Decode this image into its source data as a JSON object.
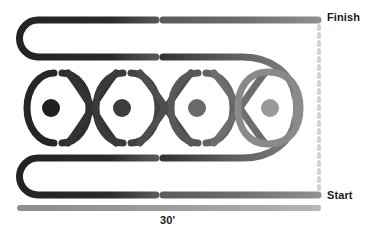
{
  "diagram": {
    "labels": {
      "finish": "Finish",
      "start": "Start",
      "distance": "30'"
    },
    "colors": {
      "darkest": "#2b2b2b",
      "dark": "#3a3a3a",
      "mid_dark": "#4a4a4a",
      "mid": "#5e5e5e",
      "mid_light": "#6e6e6e",
      "light": "#8c8c8c",
      "lightest": "#a5a5a5",
      "dashed_guide": "#cfcfcf",
      "background": "#ffffff",
      "text": "#1a1a1a"
    },
    "cones": [
      {
        "id": "cone-1",
        "cx": 51,
        "cy": 108,
        "r": 9,
        "color": "#1f1f1f"
      },
      {
        "id": "cone-2",
        "cx": 122,
        "cy": 108,
        "r": 9,
        "color": "#3c3c3c"
      },
      {
        "id": "cone-3",
        "cx": 197,
        "cy": 108,
        "r": 9,
        "color": "#6a6a6a"
      },
      {
        "id": "cone-4",
        "cx": 270,
        "cy": 108,
        "r": 9,
        "color": "#9a9a9a"
      }
    ],
    "loops": [
      {
        "id": "loop-1",
        "cx": 51,
        "cy": 108,
        "broken": true
      },
      {
        "id": "loop-2",
        "cx": 122,
        "cy": 108,
        "broken": true
      },
      {
        "id": "loop-3",
        "cx": 197,
        "cy": 108,
        "broken": true
      },
      {
        "id": "loop-4",
        "cx": 270,
        "cy": 108,
        "broken": false
      }
    ],
    "lanes": [
      {
        "id": "lane-finish",
        "y": 20,
        "x_start": 20,
        "x_end": 318
      },
      {
        "id": "lane-upper-return",
        "y": 57,
        "x_start": 20,
        "x_end": 250
      },
      {
        "id": "lane-lower-return",
        "y": 158,
        "x_start": 20,
        "x_end": 250
      },
      {
        "id": "lane-start",
        "y": 195,
        "x_start": 20,
        "x_end": 318
      }
    ],
    "measure_line": {
      "id": "measure-line",
      "y": 208,
      "x_start": 20,
      "x_end": 318
    },
    "guide_line": {
      "id": "guide-line",
      "x": 319,
      "y_start": 20,
      "y_end": 195,
      "style": "dashed"
    },
    "stroke_width": 7
  }
}
